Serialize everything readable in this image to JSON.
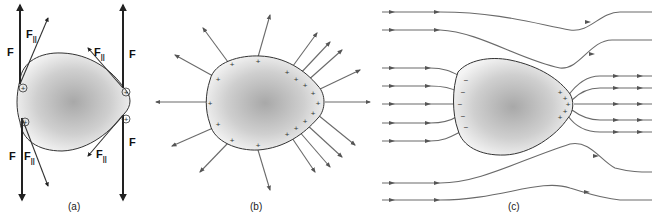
{
  "figure": {
    "colors": {
      "blob_center": "#a8a8a8",
      "blob_edge": "#f4f4f4",
      "outline": "#333333",
      "field_line": "#6a6a6a",
      "force_arrow": "#222222"
    },
    "panels": [
      {
        "id": "a",
        "caption": "(a)",
        "force_label": "F",
        "parallel_label_base": "F",
        "parallel_label_sub": "||",
        "charge_symbol": "+",
        "charge_count": 4
      },
      {
        "id": "b",
        "caption": "(b)",
        "charge_symbol": "+",
        "charge_count": 16,
        "field_line_count": 16
      },
      {
        "id": "c",
        "caption": "(c)",
        "negative_symbol": "−",
        "positive_symbol": "+",
        "negative_count": 5,
        "positive_count": 5,
        "field_line_count": 14
      }
    ]
  }
}
